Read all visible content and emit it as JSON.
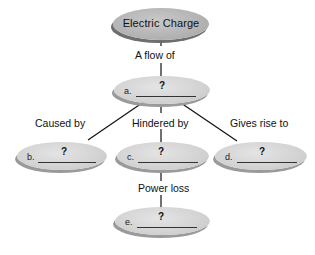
{
  "diagram": {
    "type": "concept-map",
    "root": {
      "label": "Electric Charge"
    },
    "links": {
      "root_to_a": "A flow of",
      "a_to_b": "Caused by",
      "a_to_c": "Hindered by",
      "a_to_d": "Gives rise to",
      "c_to_e": "Power loss"
    },
    "nodes": {
      "a": {
        "letter": "a.",
        "answer": "?"
      },
      "b": {
        "letter": "b.",
        "answer": "?"
      },
      "c": {
        "letter": "c.",
        "answer": "?"
      },
      "d": {
        "letter": "d.",
        "answer": "?"
      },
      "e": {
        "letter": "e.",
        "answer": "?"
      }
    },
    "colors": {
      "root_fill": "#b5b5b5",
      "node_fill": "#d4d4d4",
      "shadow": "#9a9a9a",
      "line": "#111111",
      "background": "#ffffff"
    }
  }
}
